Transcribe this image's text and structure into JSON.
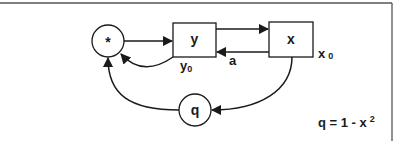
{
  "diagram": {
    "nodes": [
      {
        "id": "star",
        "shape": "circle",
        "label": "*"
      },
      {
        "id": "y",
        "shape": "box",
        "label": "y"
      },
      {
        "id": "x",
        "shape": "box",
        "label": "x"
      },
      {
        "id": "q",
        "shape": "circle",
        "label": "q"
      }
    ],
    "labels": {
      "y0_base": "y",
      "y0_sub": "0",
      "x0_base": "x",
      "x0_sub": "0",
      "a": "a",
      "formula_main": "q = 1 - x",
      "formula_sup": "2"
    },
    "edges": [
      {
        "from": "star",
        "to": "y",
        "label": ""
      },
      {
        "from": "y",
        "to": "x",
        "label": ""
      },
      {
        "from": "x",
        "to": "y",
        "label": "a"
      },
      {
        "from": "y",
        "to": "star",
        "label": ""
      },
      {
        "from": "x",
        "to": "q",
        "label": ""
      },
      {
        "from": "q",
        "to": "star",
        "label": ""
      }
    ],
    "colors": {
      "stroke": "#1a1a1a",
      "frame": "#555555",
      "background": "#ffffff"
    }
  }
}
